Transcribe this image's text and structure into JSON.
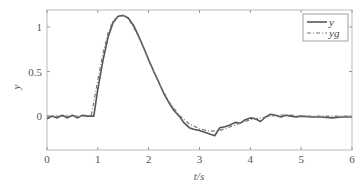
{
  "chart_data": {
    "type": "line",
    "title": "",
    "xlabel": "t/s",
    "ylabel": "y",
    "xlim": [
      0,
      6
    ],
    "ylim": [
      -0.38,
      1.19
    ],
    "xticks": [
      0,
      1,
      2,
      3,
      4,
      5,
      6
    ],
    "yticks": [
      0,
      0.5,
      1
    ],
    "ytick_labels": [
      "0",
      "0.5",
      "1"
    ],
    "grid": false,
    "legend_position": "upper right",
    "series": [
      {
        "name": "y",
        "style": "solid",
        "color": "#555555",
        "x": [
          0,
          0.1,
          0.2,
          0.3,
          0.4,
          0.5,
          0.6,
          0.7,
          0.8,
          0.92,
          1.0,
          1.1,
          1.2,
          1.3,
          1.4,
          1.5,
          1.6,
          1.7,
          1.8,
          1.9,
          2.0,
          2.1,
          2.2,
          2.3,
          2.4,
          2.5,
          2.6,
          2.7,
          2.8,
          2.9,
          3.0,
          3.1,
          3.2,
          3.3,
          3.4,
          3.5,
          3.6,
          3.7,
          3.8,
          3.9,
          4.0,
          4.1,
          4.2,
          4.3,
          4.4,
          4.5,
          4.6,
          4.7,
          4.8,
          4.9,
          5.0,
          5.2,
          5.4,
          5.6,
          5.8,
          6.0
        ],
        "values": [
          -0.03,
          0.0,
          -0.02,
          0.01,
          -0.02,
          0.01,
          -0.02,
          0.01,
          0.0,
          0.0,
          0.3,
          0.62,
          0.88,
          1.05,
          1.12,
          1.13,
          1.1,
          1.02,
          0.9,
          0.77,
          0.63,
          0.5,
          0.38,
          0.25,
          0.15,
          0.06,
          0.0,
          -0.08,
          -0.13,
          -0.15,
          -0.16,
          -0.18,
          -0.2,
          -0.22,
          -0.13,
          -0.12,
          -0.1,
          -0.07,
          -0.08,
          -0.04,
          -0.02,
          -0.03,
          -0.06,
          -0.01,
          0.02,
          0.01,
          -0.01,
          0.01,
          0.0,
          -0.01,
          0.0,
          -0.01,
          -0.01,
          -0.02,
          -0.01,
          -0.01
        ]
      },
      {
        "name": "yg",
        "style": "dashdot",
        "color": "#777777",
        "x": [
          0,
          0.2,
          0.4,
          0.6,
          0.8,
          0.87,
          1.0,
          1.1,
          1.2,
          1.3,
          1.4,
          1.5,
          1.6,
          1.7,
          1.8,
          1.9,
          2.0,
          2.2,
          2.4,
          2.6,
          2.8,
          3.0,
          3.2,
          3.4,
          3.6,
          3.8,
          4.0,
          4.2,
          4.4,
          4.6,
          4.8,
          5.0,
          5.5,
          6.0
        ],
        "values": [
          0.0,
          0.0,
          0.0,
          0.0,
          0.0,
          0.0,
          0.4,
          0.7,
          0.93,
          1.07,
          1.12,
          1.13,
          1.09,
          1.0,
          0.89,
          0.76,
          0.62,
          0.37,
          0.16,
          0.01,
          -0.09,
          -0.14,
          -0.17,
          -0.16,
          -0.12,
          -0.08,
          -0.04,
          -0.02,
          0.0,
          0.01,
          0.01,
          0.0,
          0.0,
          0.0
        ]
      }
    ]
  }
}
